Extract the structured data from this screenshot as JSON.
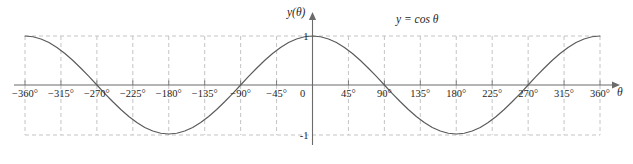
{
  "chart_data": {
    "type": "line",
    "title": "",
    "annotation": "y = cos θ",
    "xlabel": "θ",
    "ylabel": "y(θ)",
    "xlim": [
      -360,
      360
    ],
    "ylim": [
      -1,
      1
    ],
    "grid": true,
    "grid_style": "dashed",
    "legend": "none",
    "x_tick_labels": [
      "−360°",
      "−315°",
      "−270°",
      "−225°",
      "−180°",
      "−135°",
      "−90°",
      "−45°",
      "0",
      "45°",
      "90°",
      "135°",
      "180°",
      "225°",
      "270°",
      "315°",
      "360°"
    ],
    "x_ticks": [
      -360,
      -315,
      -270,
      -225,
      -180,
      -135,
      -90,
      -45,
      0,
      45,
      90,
      135,
      180,
      225,
      270,
      315,
      360
    ],
    "y_tick_labels": [
      "1",
      "-1"
    ],
    "y_ticks": [
      1,
      -1
    ],
    "series": [
      {
        "name": "y = cos θ",
        "color": "#5a5a5a",
        "x": [
          -360,
          -350,
          -340,
          -330,
          -320,
          -310,
          -300,
          -290,
          -280,
          -270,
          -260,
          -250,
          -240,
          -230,
          -220,
          -210,
          -200,
          -190,
          -180,
          -170,
          -160,
          -150,
          -140,
          -130,
          -120,
          -110,
          -100,
          -90,
          -80,
          -70,
          -60,
          -50,
          -40,
          -30,
          -20,
          -10,
          0,
          10,
          20,
          30,
          40,
          50,
          60,
          70,
          80,
          90,
          100,
          110,
          120,
          130,
          140,
          150,
          160,
          170,
          180,
          190,
          200,
          210,
          220,
          230,
          240,
          250,
          260,
          270,
          280,
          290,
          300,
          310,
          320,
          330,
          340,
          350,
          360
        ],
        "values": [
          1.0,
          0.985,
          0.94,
          0.866,
          0.766,
          0.643,
          0.5,
          0.342,
          0.174,
          0.0,
          -0.174,
          -0.342,
          -0.5,
          -0.643,
          -0.766,
          -0.866,
          -0.94,
          -0.985,
          -1.0,
          -0.985,
          -0.94,
          -0.866,
          -0.766,
          -0.643,
          -0.5,
          -0.342,
          -0.174,
          0.0,
          0.174,
          0.342,
          0.5,
          0.643,
          0.766,
          0.866,
          0.94,
          0.985,
          1.0,
          0.985,
          0.94,
          0.866,
          0.766,
          0.643,
          0.5,
          0.342,
          0.174,
          0.0,
          -0.174,
          -0.342,
          -0.5,
          -0.643,
          -0.766,
          -0.866,
          -0.94,
          -0.985,
          -1.0,
          -0.985,
          -0.94,
          -0.866,
          -0.766,
          -0.643,
          -0.5,
          -0.342,
          -0.174,
          0.0,
          0.174,
          0.342,
          0.5,
          0.643,
          0.766,
          0.866,
          0.94,
          0.985,
          1.0
        ]
      }
    ]
  },
  "labels": {
    "y_axis_title": "y(θ)",
    "x_axis_title": "θ",
    "origin": "0",
    "y_top": "1",
    "y_bottom": "-1",
    "equation": "y = cos θ"
  },
  "colors": {
    "curve": "#5a5a5a",
    "axis": "#6b6b6b",
    "grid": "#bdbdbd",
    "text": "#1f1f1f",
    "background": "#ffffff"
  }
}
